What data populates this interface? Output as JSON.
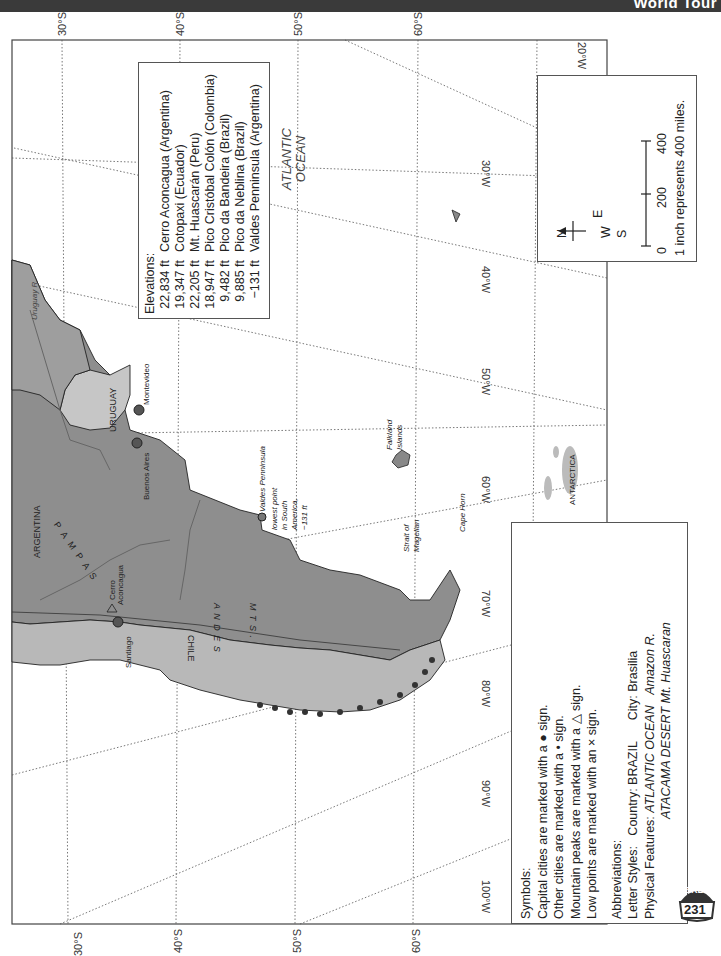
{
  "header": {
    "title": "World Tour"
  },
  "grid": {
    "latitudes": [
      "30°S",
      "40°S",
      "50°S",
      "60°S"
    ],
    "longitudes": [
      "20°W",
      "30°W",
      "40°W",
      "50°W",
      "60°W",
      "70°W",
      "80°W",
      "90°W",
      "100°W"
    ]
  },
  "elevations": {
    "title": "Elevations:",
    "items": [
      {
        "height": "22,834 ft",
        "name": "Cerro Aconcagua (Argentina)"
      },
      {
        "height": "19,347 ft",
        "name": "Cotopaxi (Ecuador)"
      },
      {
        "height": "22,205 ft",
        "name": "Mt. Huascarán (Peru)"
      },
      {
        "height": "18,947 ft",
        "name": "Pico Cristóbal Colón (Colombia)"
      },
      {
        "height": "9,482 ft",
        "name": "Pico da Bandeira (Brazil)"
      },
      {
        "height": "9,885 ft",
        "name": "Pico da Neblina (Brazil)"
      },
      {
        "height": "−131 ft",
        "name": "Valdes Penninsula (Argentina)"
      }
    ]
  },
  "scale": {
    "compass": {
      "n": "N",
      "s": "S",
      "e": "E",
      "w": "W"
    },
    "ticks": [
      "0",
      "200",
      "400"
    ],
    "note": "1 inch represents 400 miles."
  },
  "legend": {
    "symbols_title": "Symbols:",
    "symbols": [
      "Capital cities are marked with a ● sign.",
      "Other cities are marked with a • sign.",
      "Mountain peaks are marked with a △ sign.",
      "Low points are marked with an × sign."
    ],
    "abbrev_title": "Abbreviations:",
    "letter_styles_label": "Letter Styles:",
    "letter_styles_country": "Country: BRAZIL",
    "letter_styles_city": "City: Brasilia",
    "physical_label": "Physical Features:",
    "physical_1": "ATLANTIC OCEAN",
    "physical_2": "Amazon R.",
    "physical_3": "ATACAMA DESERT Mt. Huascaran"
  },
  "map_labels": {
    "ocean": [
      "ATLANTIC",
      "OCEAN"
    ],
    "argentina": "ARGENTINA",
    "uruguay": "URUGUAY",
    "chile": "CHILE",
    "pampas": "P A M P A S",
    "andes": "A N D E S",
    "mts": "M T S .",
    "montevideo": "Montevideo",
    "buenos_aires": "Buenos Aires",
    "santiago": "Santiago",
    "cerro": "Cerro",
    "aconcagua": "Aconcagua",
    "uruguay_river": "Uruguay R.",
    "valdes": "Valdes Penninsula",
    "valdes_note": [
      "lowest point",
      "in South",
      "America,",
      "−131 ft"
    ],
    "falkland": [
      "Falkland",
      "Islands"
    ],
    "strait": [
      "Strait of",
      "Magellan"
    ],
    "cape_horn": "Cape Horn",
    "antarctica": "ANTARCTICA"
  },
  "badge": {
    "top": "SRB",
    "number": "231"
  }
}
